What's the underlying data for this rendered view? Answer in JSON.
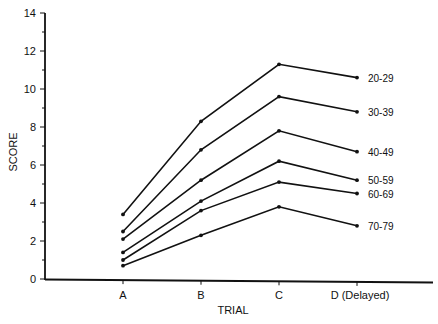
{
  "chart_data": {
    "type": "line",
    "title": "",
    "xlabel": "TRIAL",
    "ylabel": "SCORE",
    "categories": [
      "A",
      "B",
      "C",
      "D (Delayed)"
    ],
    "ylim": [
      0,
      14
    ],
    "y_ticks": [
      0,
      2,
      4,
      6,
      8,
      10,
      12,
      14
    ],
    "grid": false,
    "legend_position": "inline-right",
    "series": [
      {
        "name": "20-29",
        "values": [
          3.4,
          8.3,
          11.3,
          10.6
        ]
      },
      {
        "name": "30-39",
        "values": [
          2.5,
          6.8,
          9.6,
          8.8
        ]
      },
      {
        "name": "40-49",
        "values": [
          2.1,
          5.2,
          7.8,
          6.7
        ]
      },
      {
        "name": "50-59",
        "values": [
          1.4,
          4.1,
          6.2,
          5.2
        ]
      },
      {
        "name": "60-69",
        "values": [
          1.0,
          3.6,
          5.1,
          4.5
        ]
      },
      {
        "name": "70-79",
        "values": [
          0.7,
          2.3,
          3.8,
          2.8
        ]
      }
    ]
  }
}
